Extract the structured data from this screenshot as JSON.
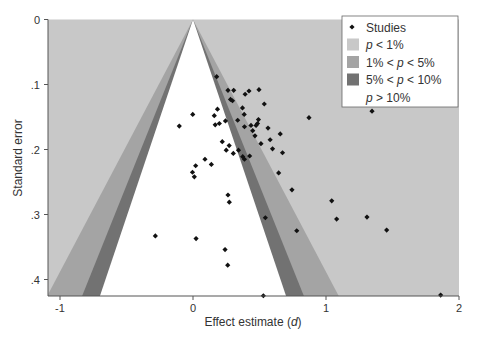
{
  "chart_data": {
    "type": "scatter",
    "subtype": "contour-enhanced funnel plot",
    "title": "",
    "xlabel": "Effect estimate (d)",
    "xlabel_parts": {
      "prefix": "Effect estimate (",
      "italic": "d",
      "suffix": ")"
    },
    "ylabel": "Standard error",
    "xlim": [
      -1.1,
      2.0
    ],
    "ylim": [
      0.0,
      0.425
    ],
    "y_reversed": true,
    "x_ticks": [
      -1,
      0,
      1,
      2
    ],
    "x_tick_labels": [
      "-1",
      "0",
      "1",
      "2"
    ],
    "y_ticks": [
      0,
      0.1,
      0.2,
      0.3,
      0.4
    ],
    "y_tick_labels": [
      "0",
      ".1",
      ".2",
      ".3",
      ".4"
    ],
    "grid": false,
    "legend_position": "top-right (inside)",
    "funnel_center": 0,
    "contours": [
      {
        "label": "p < 1%",
        "z": 2.576,
        "color": "#c8c8c8"
      },
      {
        "label": "1% < p < 5%",
        "z_inner": 1.96,
        "z_outer": 2.576,
        "color": "#a4a4a4"
      },
      {
        "label": "5% < p < 10%",
        "z_inner": 1.645,
        "z_outer": 1.96,
        "color": "#727272"
      },
      {
        "label": "p > 10%",
        "z": 1.645,
        "color": "#ffffff"
      }
    ],
    "series": [
      {
        "name": "Studies",
        "marker": "diamond",
        "color": "#111111",
        "points": [
          [
            0.178,
            0.088
          ],
          [
            0.263,
            0.109
          ],
          [
            0.306,
            0.109
          ],
          [
            0.421,
            0.11
          ],
          [
            0.392,
            0.115
          ],
          [
            0.496,
            0.108
          ],
          [
            0.282,
            0.123
          ],
          [
            0.297,
            0.125
          ],
          [
            0.372,
            0.136
          ],
          [
            0.536,
            0.13
          ],
          [
            -0.002,
            0.146
          ],
          [
            0.184,
            0.138
          ],
          [
            0.16,
            0.148
          ],
          [
            0.385,
            0.146
          ],
          [
            -0.103,
            0.164
          ],
          [
            0.167,
            0.162
          ],
          [
            0.198,
            0.16
          ],
          [
            0.244,
            0.156
          ],
          [
            0.336,
            0.155
          ],
          [
            0.492,
            0.154
          ],
          [
            0.485,
            0.16
          ],
          [
            0.436,
            0.163
          ],
          [
            0.387,
            0.165
          ],
          [
            0.474,
            0.163
          ],
          [
            0.564,
            0.167
          ],
          [
            0.449,
            0.171
          ],
          [
            0.466,
            0.179
          ],
          [
            0.58,
            0.185
          ],
          [
            0.22,
            0.188
          ],
          [
            0.511,
            0.191
          ],
          [
            0.872,
            0.151
          ],
          [
            1.346,
            0.141
          ],
          [
            0.656,
            0.176
          ],
          [
            0.598,
            0.199
          ],
          [
            0.673,
            0.205
          ],
          [
            0.272,
            0.194
          ],
          [
            0.25,
            0.201
          ],
          [
            0.303,
            0.206
          ],
          [
            0.342,
            0.201
          ],
          [
            0.374,
            0.211
          ],
          [
            0.387,
            0.215
          ],
          [
            0.426,
            0.21
          ],
          [
            0.09,
            0.215
          ],
          [
            0.138,
            0.223
          ],
          [
            0.02,
            0.225
          ],
          [
            -0.004,
            0.235
          ],
          [
            0.01,
            0.242
          ],
          [
            0.644,
            0.236
          ],
          [
            0.744,
            0.262
          ],
          [
            1.043,
            0.279
          ],
          [
            0.78,
            0.325
          ],
          [
            1.08,
            0.307
          ],
          [
            1.308,
            0.304
          ],
          [
            1.456,
            0.324
          ],
          [
            0.263,
            0.27
          ],
          [
            0.273,
            0.281
          ],
          [
            0.544,
            0.305
          ],
          [
            -0.283,
            0.333
          ],
          [
            0.023,
            0.337
          ],
          [
            0.241,
            0.354
          ],
          [
            0.261,
            0.378
          ],
          [
            0.529,
            0.425
          ],
          [
            1.862,
            0.424
          ]
        ]
      }
    ]
  },
  "legend": {
    "items": [
      {
        "label": "Studies",
        "type": "marker",
        "pre": "",
        "italic": "",
        "post": "Studies"
      },
      {
        "label": "p < 1%",
        "type": "swatch",
        "color": "#c8c8c8",
        "pre": "",
        "italic": "p",
        "post": " < 1%"
      },
      {
        "label": "1% < p < 5%",
        "type": "swatch",
        "color": "#a4a4a4",
        "pre": "1% < ",
        "italic": "p",
        "post": " < 5%"
      },
      {
        "label": "5% < p < 10%",
        "type": "swatch",
        "color": "#727272",
        "pre": "5% < ",
        "italic": "p",
        "post": " < 10%"
      },
      {
        "label": "p > 10%",
        "type": "swatch",
        "color": "#ffffff",
        "pre": "",
        "italic": "p",
        "post": " > 10%"
      }
    ]
  },
  "colors": {
    "background": "#c8c8c8",
    "axis": "#555555",
    "text": "#333333",
    "marker": "#111111"
  }
}
